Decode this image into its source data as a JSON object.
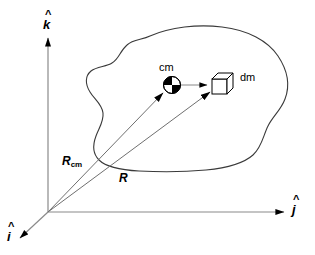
{
  "figure": {
    "background_color": "#ffffff",
    "line_color": "#000000",
    "blob_outline_color": "#3a3a3a",
    "axis_color": "#7a7a7a",
    "vector_color": "#6a6a6a"
  },
  "axes": {
    "vertical": {
      "label": "k",
      "hat": "^",
      "name": "k-hat-axis"
    },
    "horizontal": {
      "label": "j",
      "hat": "^",
      "name": "j-hat-axis"
    },
    "depth": {
      "label": "i",
      "hat": "^",
      "name": "i-hat-axis"
    }
  },
  "vectors": [
    {
      "label": "R",
      "subscript": "cm",
      "name": "r-cm-vector",
      "description": "position vector from origin to center of mass"
    },
    {
      "label": "R",
      "subscript": "",
      "name": "r-vector",
      "description": "position vector from origin to mass element dm"
    }
  ],
  "markers": {
    "center_of_mass": {
      "label": "cm",
      "name": "center-of-mass-marker"
    },
    "mass_element": {
      "label": "dm",
      "name": "mass-element-cube"
    }
  }
}
